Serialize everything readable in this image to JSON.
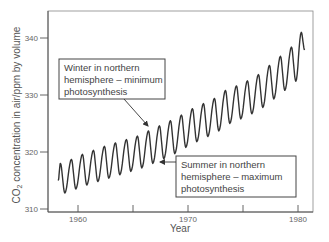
{
  "chart_data": {
    "type": "line",
    "title": "",
    "xlabel": "Year",
    "ylabel": "CO2 concentration in air/ppm by volume",
    "ylabel_parts": {
      "pre": "CO",
      "sub": "2",
      "post": " concentration in air/ppm by volume"
    },
    "xlim": [
      1957.4,
      1981.3
    ],
    "ylim": [
      309.8,
      346.5
    ],
    "x_ticks": [
      1960,
      1965,
      1970,
      1975,
      1980
    ],
    "x_tick_labels": [
      "1960",
      "",
      "1970",
      "",
      "1980"
    ],
    "y_ticks": [
      310,
      320,
      330,
      340
    ],
    "y_tick_labels": [
      "310",
      "320",
      "330",
      "340"
    ],
    "grid": false,
    "series": [
      {
        "name": "Monthly atmospheric CO2 (Mauna Loa)",
        "description": "Seasonal oscillation superimposed on rising trend",
        "start_year": 1958.2,
        "end_year": 1980.6,
        "trend_start_ppm": 315.0,
        "trend_end_ppm": 338.3,
        "seasonal_amplitude_ppm": 3.0,
        "annual_peaks_approx": [
          {
            "x": 1958.4,
            "y": 318.0
          },
          {
            "x": 1959.4,
            "y": 318.7
          },
          {
            "x": 1960.4,
            "y": 319.6
          },
          {
            "x": 1961.4,
            "y": 320.3
          },
          {
            "x": 1962.4,
            "y": 321.0
          },
          {
            "x": 1963.4,
            "y": 321.6
          },
          {
            "x": 1964.4,
            "y": 322.2
          },
          {
            "x": 1965.4,
            "y": 322.8
          },
          {
            "x": 1966.4,
            "y": 323.7
          },
          {
            "x": 1967.4,
            "y": 324.6
          },
          {
            "x": 1968.4,
            "y": 325.5
          },
          {
            "x": 1969.4,
            "y": 326.5
          },
          {
            "x": 1970.4,
            "y": 327.6
          },
          {
            "x": 1971.4,
            "y": 328.5
          },
          {
            "x": 1972.4,
            "y": 329.4
          },
          {
            "x": 1973.4,
            "y": 330.8
          },
          {
            "x": 1974.4,
            "y": 331.6
          },
          {
            "x": 1975.4,
            "y": 332.5
          },
          {
            "x": 1976.4,
            "y": 333.6
          },
          {
            "x": 1977.4,
            "y": 335.2
          },
          {
            "x": 1978.4,
            "y": 336.8
          },
          {
            "x": 1979.4,
            "y": 338.4
          },
          {
            "x": 1980.3,
            "y": 341.0
          }
        ],
        "annual_troughs_approx": [
          {
            "x": 1958.8,
            "y": 312.8
          },
          {
            "x": 1959.8,
            "y": 313.5
          },
          {
            "x": 1960.8,
            "y": 314.2
          },
          {
            "x": 1961.8,
            "y": 314.8
          },
          {
            "x": 1962.8,
            "y": 315.4
          },
          {
            "x": 1963.8,
            "y": 316.0
          },
          {
            "x": 1964.8,
            "y": 316.6
          },
          {
            "x": 1965.8,
            "y": 317.2
          },
          {
            "x": 1966.8,
            "y": 318.0
          },
          {
            "x": 1967.8,
            "y": 318.8
          },
          {
            "x": 1968.8,
            "y": 319.7
          },
          {
            "x": 1969.8,
            "y": 320.8
          },
          {
            "x": 1970.8,
            "y": 321.8
          },
          {
            "x": 1971.8,
            "y": 322.7
          },
          {
            "x": 1972.8,
            "y": 323.7
          },
          {
            "x": 1973.8,
            "y": 325.0
          },
          {
            "x": 1974.8,
            "y": 325.8
          },
          {
            "x": 1975.8,
            "y": 326.7
          },
          {
            "x": 1976.8,
            "y": 327.8
          },
          {
            "x": 1977.8,
            "y": 329.3
          },
          {
            "x": 1978.8,
            "y": 330.8
          },
          {
            "x": 1979.8,
            "y": 332.4
          }
        ],
        "color": "#333333"
      }
    ],
    "annotations": [
      {
        "id": "winter",
        "lines": [
          "Winter in northern",
          "hemisphere – minimum",
          "photosynthesis"
        ],
        "points_to": {
          "x": 1966.4,
          "y": 323.7
        },
        "meaning": "seasonal peak"
      },
      {
        "id": "summer",
        "lines": [
          "Summer in northern",
          "hemisphere – maximum",
          "photosynthesis"
        ],
        "points_to": {
          "x": 1967.2,
          "y": 318.3
        },
        "meaning": "seasonal trough"
      }
    ]
  },
  "style": {
    "line_color": "#333333",
    "axis_color": "#555555",
    "frame_color": "#888888",
    "text_color": "#555555"
  }
}
